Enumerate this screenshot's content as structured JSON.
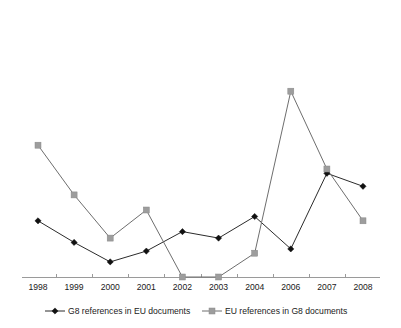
{
  "chart_data": {
    "type": "line",
    "title": "",
    "xlabel": "",
    "ylabel": "",
    "grid": false,
    "legend_position": "bottom",
    "categories": [
      "1998",
      "1999",
      "2000",
      "2001",
      "2002",
      "2003",
      "2004",
      "2006",
      "2007",
      "2008"
    ],
    "ylim": [
      0,
      100
    ],
    "yaxis_visible": false,
    "series": [
      {
        "name": "G8 references in EU documents",
        "color": "#111111",
        "marker": "diamond",
        "values": [
          26,
          16,
          7,
          12,
          21,
          18,
          28,
          13,
          48,
          42
        ]
      },
      {
        "name": "EU references in G8 documents",
        "color": "#9d9d9d",
        "marker": "square",
        "values": [
          61,
          38,
          18,
          31,
          0,
          0,
          11,
          86,
          50,
          26
        ]
      }
    ]
  },
  "axis": {
    "tick_labels": [
      "1998",
      "1999",
      "2000",
      "2001",
      "2002",
      "2003",
      "2004",
      "2006",
      "2007",
      "2008"
    ],
    "axis_color": "#9a9a9a"
  },
  "legend": {
    "items": [
      {
        "label": "G8 references in EU documents",
        "color": "#111111",
        "marker": "diamond"
      },
      {
        "label": "EU references in G8 documents",
        "color": "#9d9d9d",
        "marker": "square"
      }
    ]
  }
}
